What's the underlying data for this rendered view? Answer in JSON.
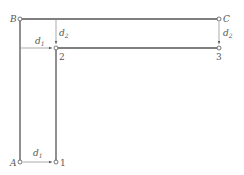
{
  "diagram": {
    "colors": {
      "line": "#555555",
      "dim": "#888888",
      "background": "#ffffff"
    },
    "points": {
      "A": {
        "label": "A",
        "x": 20,
        "y": 162
      },
      "B": {
        "label": "B",
        "x": 20,
        "y": 19
      },
      "C": {
        "label": "C",
        "x": 219,
        "y": 19
      },
      "p1": {
        "label": "1",
        "x": 56,
        "y": 162
      },
      "p2": {
        "label": "2",
        "x": 56,
        "y": 48
      },
      "p3": {
        "label": "3",
        "x": 219,
        "y": 48
      }
    },
    "dimensions": {
      "d1_bottom": {
        "main": "d",
        "sub": "1"
      },
      "d1_mid": {
        "main": "d",
        "sub": "1"
      },
      "d2_left": {
        "main": "d",
        "sub": "2"
      },
      "d2_right": {
        "main": "d",
        "sub": "2"
      }
    }
  }
}
